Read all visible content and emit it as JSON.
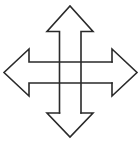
{
  "icon": {
    "name": "four-way-move-arrows",
    "stroke_color": "#2a2a2a",
    "background": "#ffffff"
  }
}
